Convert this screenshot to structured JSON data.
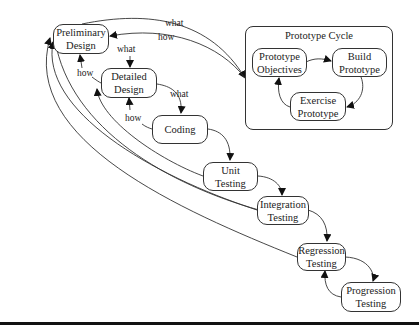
{
  "diagram": {
    "nodes": {
      "preliminary_design": "Preliminary\nDesign",
      "detailed_design": "Detailed\nDesign",
      "coding": "Coding",
      "unit_testing": "Unit\nTesting",
      "integration_testing": "Integration\nTesting",
      "regression_testing": "Regression\nTesting",
      "progression_testing": "Progression\nTesting"
    },
    "prototype_cycle": {
      "title": "Prototype Cycle",
      "objectives": "Prototype\nObjectives",
      "build": "Build\nPrototype",
      "exercise": "Exercise\nPrototype"
    },
    "edge_labels": {
      "prelim_to_cycle_what": "what",
      "cycle_to_prelim_how": "how",
      "prelim_to_detailed_what": "what",
      "detailed_to_prelim_how": "how",
      "detailed_to_coding_what": "what",
      "coding_to_detailed_how": "how"
    },
    "colors": {
      "line": "#333333",
      "text": "#222222",
      "background": "#ffffff"
    }
  }
}
